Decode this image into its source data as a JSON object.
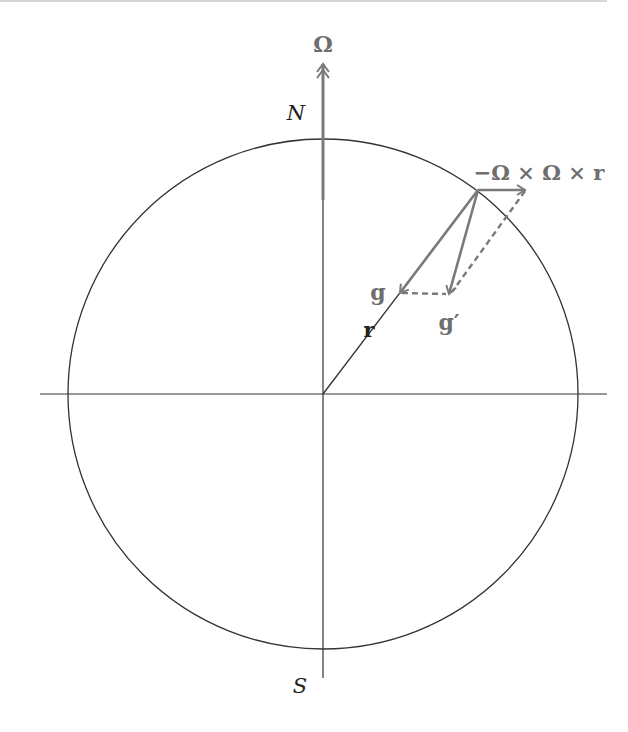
{
  "diagram": {
    "colors": {
      "background": "#ffffff",
      "line": "#333333",
      "vector": "#7a7a7a",
      "label_vector": "#6e6e6e",
      "label_black": "#222222",
      "top_rule": "#c8c8c8"
    },
    "labels": {
      "omega": "Ω",
      "north": "N",
      "south": "S",
      "radius": "r",
      "gravity": "g",
      "effective_gravity": "g′",
      "centrifugal": "−Ω × Ω × r"
    },
    "geometry": {
      "center": [
        323,
        394
      ],
      "radius": 255,
      "surface_point": [
        478,
        190
      ],
      "g_tip": [
        400,
        293
      ],
      "g_prime_tip": [
        449,
        294
      ],
      "centrifugal_tip": [
        525,
        190
      ],
      "omega_tip": [
        323,
        62
      ],
      "omega_base": [
        323,
        200
      ]
    }
  }
}
